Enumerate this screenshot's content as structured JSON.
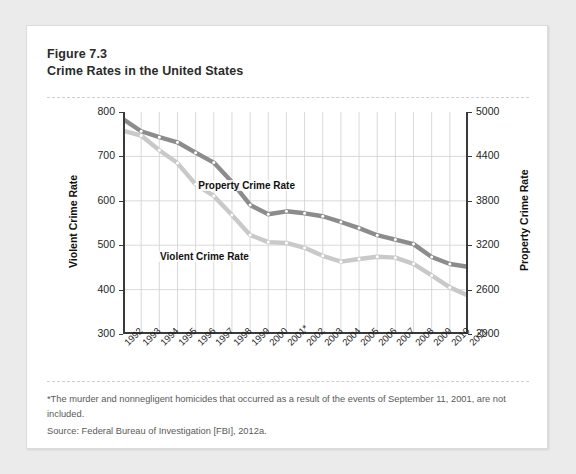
{
  "figure": {
    "number": "Figure 7.3",
    "title": "Crime Rates in the United States"
  },
  "notes": {
    "footnote": "*The murder and nonnegligent homicides that occurred as a result of the events of September 11, 2001, are not included.",
    "source": "Source: Federal Bureau of Investigation [FBI], 2012a."
  },
  "colors": {
    "property_line": "#8c8c8c",
    "violent_line": "#c9c9c9",
    "axis": "#3a3a3a",
    "grid": "#cfcfcf",
    "card_background": "#ffffff",
    "page_background": "#ebebeb"
  },
  "chart_data": {
    "type": "line",
    "title": "Crime Rates in the United States",
    "xlabel": "",
    "ylabel": "Violent Crime Rate",
    "y2label": "Property Crime Rate",
    "ylim": [
      300,
      800
    ],
    "y2lim": [
      2000,
      5000
    ],
    "yticks": [
      300,
      400,
      500,
      600,
      700,
      800
    ],
    "y2ticks": [
      2000,
      2600,
      3200,
      3800,
      4400,
      5000
    ],
    "grid": true,
    "legend_position": "inline-annotation",
    "categories": [
      "1992",
      "1993",
      "1994",
      "1995",
      "1996",
      "1997",
      "1998",
      "1999",
      "2000",
      "2001*",
      "2002",
      "2003",
      "2004",
      "2005",
      "2006",
      "2007",
      "2008",
      "2009",
      "2010",
      "2011"
    ],
    "series": [
      {
        "name": "Property Crime Rate",
        "axis": "right",
        "color": "#8c8c8c",
        "values": [
          4903,
          4740,
          4660,
          4591,
          4451,
          4316,
          4053,
          3744,
          3618,
          3658,
          3631,
          3591,
          3514,
          3431,
          3335,
          3276,
          3215,
          3041,
          2946,
          2908
        ]
      },
      {
        "name": "Violent Crime Rate",
        "axis": "left",
        "color": "#c9c9c9",
        "values": [
          758,
          747,
          714,
          685,
          637,
          611,
          568,
          523,
          507,
          505,
          494,
          476,
          463,
          469,
          474,
          472,
          458,
          432,
          405,
          387
        ]
      }
    ],
    "annotations": [
      {
        "text": "Property Crime Rate",
        "near_category": "2000"
      },
      {
        "text": "Violent Crime Rate",
        "near_category": "1999"
      }
    ]
  }
}
